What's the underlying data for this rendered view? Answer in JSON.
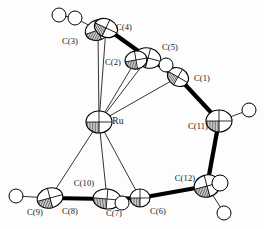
{
  "figure": {
    "type": "ortep-crystal-structure-diagram",
    "caption": "",
    "background_color": "#fdfdfd",
    "line_color": "#000000",
    "ellipsoid_fill": "#ffffff",
    "ellipsoid_shade": "#808080",
    "hydrogen_fill": "#ffffff",
    "central_metal": "Ru"
  },
  "labels": [
    {
      "id": "label-c3",
      "text": "C(3)",
      "x": 70,
      "y": 41
    },
    {
      "id": "label-c4",
      "text": "C(4)",
      "x": 124,
      "y": 27
    },
    {
      "id": "label-c5",
      "text": "C(5)",
      "x": 170,
      "y": 47
    },
    {
      "id": "label-c2",
      "text": "C(2)",
      "x": 113,
      "y": 62
    },
    {
      "id": "label-c1",
      "text": "C(1)",
      "x": 202,
      "y": 78
    },
    {
      "id": "label-ru",
      "text": "Ru",
      "x": 118,
      "y": 122
    },
    {
      "id": "label-c11",
      "text": "C(11)",
      "x": 198,
      "y": 126
    },
    {
      "id": "label-c12",
      "text": "C(12)",
      "x": 185,
      "y": 178
    },
    {
      "id": "label-c10",
      "text": "C(10)",
      "x": 84,
      "y": 183
    },
    {
      "id": "label-c9",
      "text": "C(9)",
      "x": 35,
      "y": 212
    },
    {
      "id": "label-c8",
      "text": "C(8)",
      "x": 70,
      "y": 211
    },
    {
      "id": "label-c7",
      "text": "C(7)",
      "x": 114,
      "y": 213
    },
    {
      "id": "label-c6",
      "text": "C(6)",
      "x": 158,
      "y": 211
    }
  ],
  "atoms": [
    {
      "id": "C3",
      "element": "C",
      "x": 98,
      "y": 30,
      "rx": 13,
      "ry": 10,
      "rot": -20,
      "kind": "ellipsoid"
    },
    {
      "id": "C4",
      "element": "C",
      "x": 106,
      "y": 28,
      "rx": 12,
      "ry": 9,
      "rot": 25,
      "kind": "ellipsoid"
    },
    {
      "id": "C5",
      "element": "C",
      "x": 148,
      "y": 58,
      "rx": 13,
      "ry": 10,
      "rot": 15,
      "kind": "ellipsoid"
    },
    {
      "id": "C2",
      "element": "C",
      "x": 136,
      "y": 60,
      "rx": 11,
      "ry": 9,
      "rot": -10,
      "kind": "ellipsoid"
    },
    {
      "id": "C1",
      "element": "C",
      "x": 178,
      "y": 77,
      "rx": 11,
      "ry": 9,
      "rot": 30,
      "kind": "ellipsoid"
    },
    {
      "id": "Ru",
      "element": "Ru",
      "x": 99,
      "y": 122,
      "rx": 13,
      "ry": 11,
      "rot": 0,
      "kind": "ellipsoid"
    },
    {
      "id": "C11",
      "element": "C",
      "x": 219,
      "y": 121,
      "rx": 13,
      "ry": 11,
      "rot": 0,
      "kind": "ellipsoid"
    },
    {
      "id": "C12",
      "element": "C",
      "x": 207,
      "y": 186,
      "rx": 13,
      "ry": 11,
      "rot": -15,
      "kind": "ellipsoid"
    },
    {
      "id": "C6",
      "element": "C",
      "x": 140,
      "y": 198,
      "rx": 10,
      "ry": 9,
      "rot": 0,
      "kind": "ellipsoid"
    },
    {
      "id": "C7",
      "element": "C",
      "x": 107,
      "y": 199,
      "rx": 14,
      "ry": 10,
      "rot": 5,
      "kind": "ellipsoid"
    },
    {
      "id": "C8",
      "element": "C",
      "x": 50,
      "y": 198,
      "rx": 13,
      "ry": 10,
      "rot": -15,
      "kind": "ellipsoid"
    },
    {
      "id": "H3a",
      "element": "H",
      "x": 59,
      "y": 15,
      "rx": 7,
      "ry": 7,
      "rot": 0,
      "kind": "hydrogen"
    },
    {
      "id": "H3b",
      "element": "H",
      "x": 75,
      "y": 18,
      "rx": 7,
      "ry": 7,
      "rot": 0,
      "kind": "hydrogen"
    },
    {
      "id": "H5",
      "element": "H",
      "x": 166,
      "y": 65,
      "rx": 7,
      "ry": 7,
      "rot": 0,
      "kind": "hydrogen"
    },
    {
      "id": "H11",
      "element": "H",
      "x": 249,
      "y": 110,
      "rx": 7,
      "ry": 7,
      "rot": 0,
      "kind": "hydrogen"
    },
    {
      "id": "H12a",
      "element": "H",
      "x": 220,
      "y": 183,
      "rx": 8,
      "ry": 8,
      "rot": 0,
      "kind": "hydrogen"
    },
    {
      "id": "H12b",
      "element": "H",
      "x": 224,
      "y": 213,
      "rx": 7,
      "ry": 7,
      "rot": 0,
      "kind": "hydrogen"
    },
    {
      "id": "H7",
      "element": "H",
      "x": 122,
      "y": 203,
      "rx": 7,
      "ry": 7,
      "rot": 0,
      "kind": "hydrogen"
    },
    {
      "id": "H9",
      "element": "H",
      "x": 16,
      "y": 196,
      "rx": 7,
      "ry": 7,
      "rot": 0,
      "kind": "hydrogen"
    }
  ],
  "bonds_thick": [
    {
      "from": "C4",
      "to": "C5"
    },
    {
      "from": "C5",
      "to": "C1"
    },
    {
      "from": "C1",
      "to": "C11"
    },
    {
      "from": "C11",
      "to": "C12"
    },
    {
      "from": "C12",
      "to": "C6"
    },
    {
      "from": "C6",
      "to": "C7"
    },
    {
      "from": "C7",
      "to": "C8"
    },
    {
      "from": "C3",
      "to": "C4"
    }
  ],
  "bonds_thin": [
    {
      "from": "Ru",
      "to": "C3"
    },
    {
      "from": "Ru",
      "to": "C4"
    },
    {
      "from": "Ru",
      "to": "C2"
    },
    {
      "from": "Ru",
      "to": "C5"
    },
    {
      "from": "Ru",
      "to": "C1"
    },
    {
      "from": "Ru",
      "to": "C8"
    },
    {
      "from": "Ru",
      "to": "C7"
    },
    {
      "from": "Ru",
      "to": "C6"
    },
    {
      "from": "C2",
      "to": "C5"
    },
    {
      "from": "C8",
      "to": "H9"
    },
    {
      "from": "C11",
      "to": "H11"
    },
    {
      "from": "C12",
      "to": "H12b"
    },
    {
      "from": "C5",
      "to": "H5"
    },
    {
      "from": "C3",
      "to": "H3b"
    },
    {
      "from": "H3b",
      "to": "H3a"
    }
  ]
}
